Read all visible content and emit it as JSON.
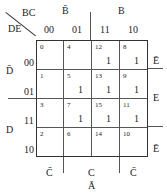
{
  "kmap": {
    "corner": {
      "row_vars": "DE",
      "col_vars": "BC"
    },
    "col_group_labels": {
      "left": "B̄",
      "right": "B"
    },
    "col_headers": [
      "00",
      "01",
      "11",
      "10"
    ],
    "row_headers": [
      "00",
      "01",
      "11",
      "10"
    ],
    "row_group_labels": {
      "top": "D̄",
      "bottom": "D"
    },
    "right_labels": {
      "top": "Ē",
      "middle": "E",
      "bottom": "Ē"
    },
    "bottom_labels": {
      "left": "C̄",
      "middle": "C",
      "right": "C̄"
    },
    "map_label": "Ā",
    "cells": [
      [
        {
          "index": "0",
          "value": ""
        },
        {
          "index": "4",
          "value": ""
        },
        {
          "index": "12",
          "value": "1"
        },
        {
          "index": "8",
          "value": "1"
        }
      ],
      [
        {
          "index": "1",
          "value": ""
        },
        {
          "index": "5",
          "value": "1"
        },
        {
          "index": "13",
          "value": "1"
        },
        {
          "index": "9",
          "value": "1"
        }
      ],
      [
        {
          "index": "3",
          "value": ""
        },
        {
          "index": "7",
          "value": "1"
        },
        {
          "index": "15",
          "value": "1"
        },
        {
          "index": "11",
          "value": "1"
        }
      ],
      [
        {
          "index": "2",
          "value": ""
        },
        {
          "index": "6",
          "value": ""
        },
        {
          "index": "14",
          "value": ""
        },
        {
          "index": "10",
          "value": ""
        }
      ]
    ]
  }
}
